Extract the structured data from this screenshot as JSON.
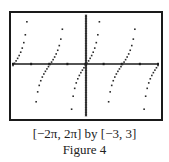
{
  "chart_data": {
    "type": "scatter",
    "title": "",
    "function": "y = tan(x)",
    "xlabel": "",
    "ylabel": "",
    "xlim": [
      -6.2832,
      6.2832
    ],
    "ylim": [
      -3,
      3
    ],
    "x_tick_spacing": 1.5708,
    "x_ticks": [
      "-2π",
      "-3π/2",
      "-π",
      "-π/2",
      "0",
      "π/2",
      "π",
      "3π/2",
      "2π"
    ],
    "y_tick_spacing": 0.1,
    "grid": false,
    "legend": null,
    "samples": 95,
    "window_label": "[−2π, 2π] by [−3, 3]"
  },
  "caption": {
    "window": "[−2π, 2π] by [−3, 3]",
    "figure": "Figure 4"
  },
  "colors": {
    "frame": "#1a1a1a",
    "axis": "#1a1a1a",
    "points": "#2a2a2a",
    "background": "#ffffff"
  },
  "plot_area": {
    "left": 13,
    "right": 158,
    "top": 15,
    "bottom": 116,
    "x_axis_y": 64,
    "y_axis_x": 86
  }
}
